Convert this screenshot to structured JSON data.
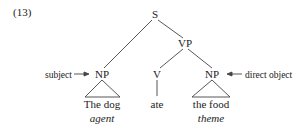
{
  "example_number": "(13)",
  "tree": {
    "root": "S",
    "vp": "VP",
    "subject_np": "NP",
    "verb": "V",
    "object_np": "NP",
    "subject_words": "The dog",
    "verb_word": "ate",
    "object_words": "the food"
  },
  "roles": {
    "subject_role": "agent",
    "object_role": "theme"
  },
  "annotations": {
    "subject_label": "subject",
    "object_label": "direct object"
  },
  "colors": {
    "line": "#333333",
    "text": "#222222"
  }
}
